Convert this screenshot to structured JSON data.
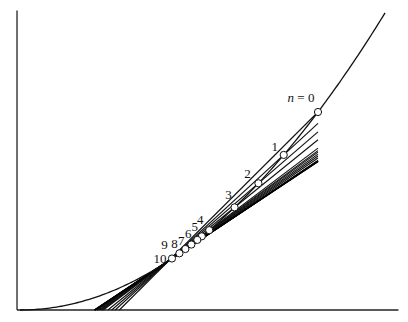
{
  "chart_data": {
    "type": "line",
    "title": "",
    "xlabel": "",
    "ylabel": "",
    "grid": false,
    "legend": "none",
    "function": "y = x^2",
    "curve_x_range": [
      0,
      2.45
    ],
    "xlim": [
      -0.02,
      2.54
    ],
    "ylim": [
      0,
      6.05
    ],
    "fixed_point": {
      "x": 1.0,
      "y": 1.0
    },
    "secant_right_end_x": 2.0,
    "points": [
      {
        "n": 0,
        "label": "n = 0",
        "x": 2.0
      },
      {
        "n": 1,
        "label": "1",
        "x": 1.77
      },
      {
        "n": 2,
        "label": "2",
        "x": 1.6
      },
      {
        "n": 3,
        "label": "3",
        "x": 1.44
      },
      {
        "n": 4,
        "label": "4",
        "x": 1.27
      },
      {
        "n": 5,
        "label": "5",
        "x": 1.22
      },
      {
        "n": 6,
        "label": "6",
        "x": 1.19
      },
      {
        "n": 7,
        "label": "7",
        "x": 1.15
      },
      {
        "n": 8,
        "label": "8",
        "x": 1.11
      },
      {
        "n": 9,
        "label": "9",
        "x": 1.07
      },
      {
        "n": 10,
        "label": "10",
        "x": 1.02
      }
    ],
    "limit_secant_h": [
      0.015,
      0.01,
      0.006,
      0.003,
      0.0
    ],
    "annotations": [
      "n = 0",
      "1",
      "2",
      "3",
      "4",
      "5",
      "6",
      "7",
      "8",
      "9",
      "10"
    ]
  }
}
